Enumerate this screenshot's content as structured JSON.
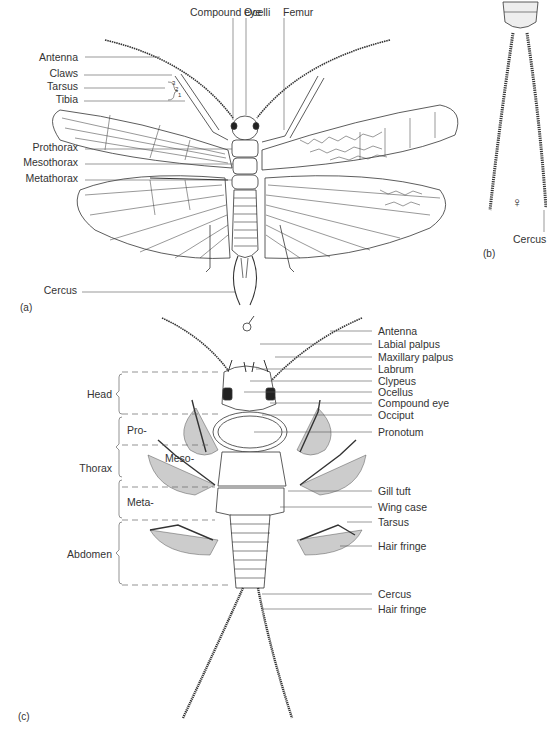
{
  "figure": {
    "panels": [
      {
        "id": "a",
        "tag": "(a)",
        "sex_symbol": "♂"
      },
      {
        "id": "b",
        "tag": "(b)",
        "sex_symbol": "♀"
      },
      {
        "id": "c",
        "tag": "(c)"
      }
    ]
  },
  "panel_a": {
    "top_labels": [
      "Compound eye",
      "Ocelli",
      "Femur"
    ],
    "left_labels": [
      "Antenna",
      "Claws",
      "Tarsus",
      "Tibia",
      "Prothorax",
      "Mesothorax",
      "Metathorax",
      "Cercus"
    ],
    "tarsus_segments": [
      "3",
      "2",
      "1"
    ]
  },
  "panel_b": {
    "labels": [
      "Cercus"
    ]
  },
  "panel_c": {
    "right_labels": [
      "Antenna",
      "Labial palpus",
      "Maxillary palpus",
      "Labrum",
      "Clypeus",
      "Ocellus",
      "Compound eye",
      "Occiput",
      "Pronotum",
      "Gill tuft",
      "Wing case",
      "Tarsus",
      "Hair fringe",
      "Cercus",
      "Hair fringe"
    ],
    "regions": [
      "Head",
      "Thorax",
      "Abdomen"
    ],
    "thorax_segments": [
      "Pro-",
      "Meso-",
      "Meta-"
    ]
  }
}
